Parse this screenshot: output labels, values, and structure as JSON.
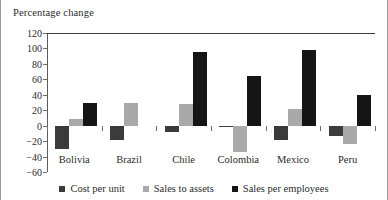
{
  "chart_data": {
    "type": "bar",
    "title": "Percentage change",
    "xlabel": "",
    "ylabel": "Percentage change",
    "ylim": [
      -60,
      120
    ],
    "yticks": [
      120,
      100,
      80,
      60,
      40,
      20,
      0,
      "−20",
      "−40",
      "−60"
    ],
    "ytick_values": [
      120,
      100,
      80,
      60,
      40,
      20,
      0,
      -20,
      -40,
      -60
    ],
    "grid": false,
    "legend_position": "bottom",
    "categories": [
      "Bolivia",
      "Brazil",
      "Chile",
      "Colombia",
      "Mexico",
      "Peru"
    ],
    "series": [
      {
        "name": "Cost per unit",
        "color": "#3b3b3b",
        "values": [
          -30,
          -19,
          -8,
          -2,
          -19,
          -14
        ]
      },
      {
        "name": "Sales to assets",
        "color": "#a9a9a9",
        "values": [
          8,
          29,
          28,
          -34,
          22,
          -24
        ]
      },
      {
        "name": "Sales per employees",
        "color": "#151515",
        "values": [
          30,
          null,
          96,
          64,
          98,
          40
        ]
      }
    ]
  }
}
